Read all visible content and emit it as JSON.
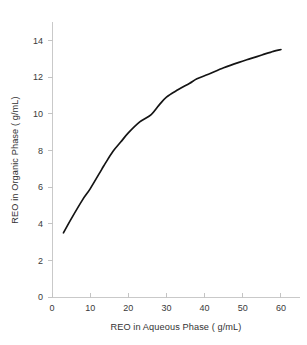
{
  "chart_data": {
    "type": "line",
    "title": "",
    "xlabel": "REO in Aqueous Phase ( g/mL)",
    "ylabel": "REO in Organic Phase ( g/mL)",
    "xlim": [
      0,
      65
    ],
    "ylim": [
      0,
      15
    ],
    "xticks": [
      0,
      10,
      20,
      30,
      40,
      50,
      60
    ],
    "xtick_labels": [
      "0",
      "10",
      "20",
      "30",
      "40",
      "50",
      "60"
    ],
    "yticks": [
      0,
      2,
      4,
      6,
      8,
      10,
      12,
      14
    ],
    "ytick_labels": [
      "0",
      "2",
      "4",
      "6",
      "8",
      "10",
      "12",
      "14"
    ],
    "grid": false,
    "legend": false,
    "series": [
      {
        "name": "REO distribution isotherm",
        "color": "#141414",
        "x": [
          3,
          5,
          8,
          10,
          13,
          14,
          16,
          18,
          20,
          23,
          26,
          28,
          30,
          33,
          36,
          38,
          41,
          45,
          49,
          52,
          55,
          58,
          60
        ],
        "y": [
          3.5,
          4.25,
          5.3,
          5.9,
          6.95,
          7.3,
          7.95,
          8.45,
          8.95,
          9.55,
          9.95,
          10.45,
          10.9,
          11.3,
          11.65,
          11.9,
          12.15,
          12.5,
          12.8,
          13.0,
          13.2,
          13.4,
          13.5
        ]
      }
    ],
    "colors": {
      "curve": "#141414",
      "axis": "#c9c9c9",
      "tick_text": "#3a3a3a",
      "label_text": "#333333",
      "background": "#ffffff"
    }
  },
  "plot_geometry": {
    "left": 52,
    "right": 300,
    "top": 22,
    "bottom": 297,
    "x_unit_px": 3.4,
    "y_unit_px": 19.07
  }
}
